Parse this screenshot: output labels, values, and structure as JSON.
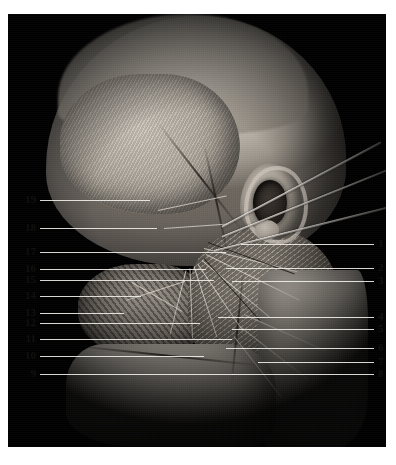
{
  "figure": {
    "kind": "anatomical-dissection-photograph",
    "view": "lateral view of head, superficial parotid and facial nerve region",
    "background_color": "#000000",
    "page_color": "#ffffff",
    "leader_line_color": "#f2f0ea",
    "label_text_color": "#111111"
  },
  "plate": {
    "x": 8,
    "y": 14,
    "width": 378,
    "height": 433
  },
  "labels": {
    "left": [
      {
        "id": "19",
        "text": "19",
        "y": 200,
        "line_end_x": 150
      },
      {
        "id": "18",
        "text": "18",
        "y": 228,
        "line_end_x": 157
      },
      {
        "id": "17",
        "text": "17",
        "y": 252,
        "line_end_x": 226
      },
      {
        "id": "16",
        "text": "16",
        "y": 269,
        "line_end_x": 206
      },
      {
        "id": "15",
        "text": "15",
        "y": 280,
        "line_end_x": 214
      },
      {
        "id": "14",
        "text": "14",
        "y": 296,
        "line_end_x": 141
      },
      {
        "id": "13",
        "text": "13",
        "y": 313,
        "line_end_x": 124
      },
      {
        "id": "12",
        "text": "12",
        "y": 323,
        "line_end_x": 200
      },
      {
        "id": "11",
        "text": "11",
        "y": 339,
        "line_end_x": 232
      },
      {
        "id": "10",
        "text": "10",
        "y": 356,
        "line_end_x": 204
      },
      {
        "id": "9",
        "text": "9",
        "y": 374,
        "line_end_x": 234
      }
    ],
    "right": [
      {
        "id": "1",
        "text": "1",
        "y": 244,
        "line_start_x": 241
      },
      {
        "id": "2",
        "text": "2",
        "y": 268,
        "line_start_x": 226
      },
      {
        "id": "3",
        "text": "3",
        "y": 281,
        "line_start_x": 232
      },
      {
        "id": "4",
        "text": "4",
        "y": 317,
        "line_start_x": 218
      },
      {
        "id": "5",
        "text": "5",
        "y": 329,
        "line_start_x": 232
      },
      {
        "id": "6",
        "text": "6",
        "y": 348,
        "line_start_x": 226
      },
      {
        "id": "7",
        "text": "7",
        "y": 362,
        "line_start_x": 258
      },
      {
        "id": "8",
        "text": "8",
        "y": 374,
        "line_start_x": 232
      }
    ]
  }
}
